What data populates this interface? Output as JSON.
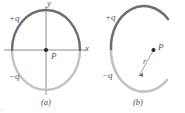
{
  "figure": {
    "type": "physics-diagram",
    "panels": [
      {
        "id": "a",
        "caption": "(a)",
        "shape": "full-circle",
        "center_label": "P",
        "axes": {
          "x_label": "x",
          "y_label": "y"
        },
        "arcs": [
          {
            "name": "positive-half",
            "label": "+q",
            "color": "#6e6e6e",
            "span": "upper half, 0 to 180 degrees"
          },
          {
            "name": "negative-half",
            "label": "-q",
            "color": "#bdbdbd",
            "span": "lower half, 180 to 360 degrees"
          }
        ],
        "labels": {
          "plus_q": "+q",
          "minus_q": "−q"
        }
      },
      {
        "id": "b",
        "caption": "(b)",
        "shape": "open-arc",
        "point_label": "P",
        "radius_label": "r",
        "arcs": [
          {
            "name": "positive-arc",
            "label": "+q",
            "color": "#6e6e6e",
            "span": "upper arc"
          },
          {
            "name": "negative-arc",
            "label": "-q",
            "color": "#bdbdbd",
            "span": "lower arc"
          }
        ],
        "labels": {
          "plus_q": "+q",
          "minus_q": "−q"
        }
      }
    ],
    "colors": {
      "positive_charge": "#6e6e6e",
      "negative_charge": "#bdbdbd",
      "axis": "#8c8c8c",
      "text": "#555555",
      "point": "#2b2b2b",
      "background": "#ffffff"
    },
    "corner_mark": "."
  }
}
